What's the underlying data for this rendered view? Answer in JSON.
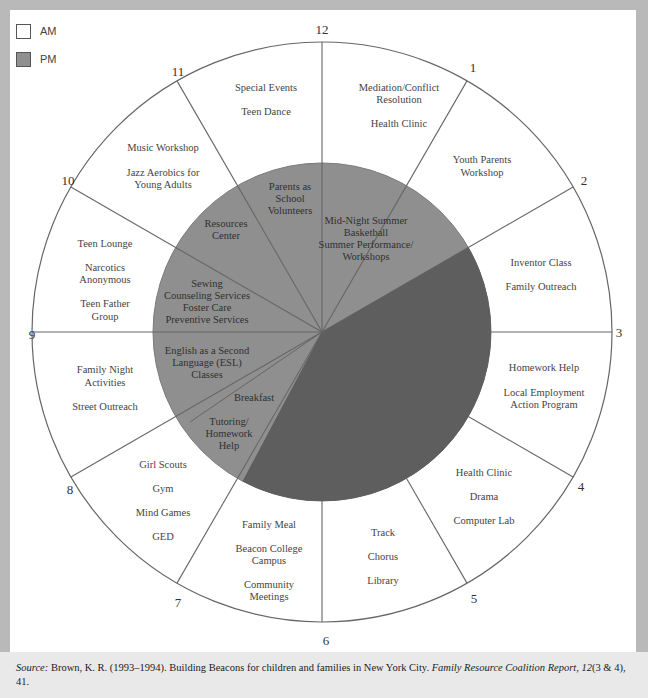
{
  "legend": {
    "items": [
      {
        "label": "AM",
        "color": "#ffffff"
      },
      {
        "label": "PM",
        "color": "#8f8f8f"
      }
    ]
  },
  "colors": {
    "background": "#b9b9b9",
    "panel": "#ffffff",
    "pm_fill": "#8f8f8f",
    "unused_fill": "#5e5e5e",
    "line": "#666666"
  },
  "clock": {
    "hours": [
      "12",
      "1",
      "2",
      "3",
      "4",
      "5",
      "6",
      "7",
      "8",
      "9",
      "10",
      "11"
    ]
  },
  "outer_segments": [
    {
      "hour_range": "12-1",
      "lines": [
        "Mediation/Conflict",
        "Resolution",
        "",
        "Health Clinic"
      ]
    },
    {
      "hour_range": "1-2",
      "lines": [
        "Youth Parents",
        "Workshop"
      ]
    },
    {
      "hour_range": "2-3",
      "lines": [
        "Inventor Class",
        "",
        "Family Outreach"
      ]
    },
    {
      "hour_range": "3-4",
      "lines": [
        "Homework Help",
        "",
        "Local Employment",
        "Action Program"
      ]
    },
    {
      "hour_range": "4-5",
      "lines": [
        "Health Clinic",
        "",
        "Drama",
        "",
        "Computer Lab"
      ]
    },
    {
      "hour_range": "5-6",
      "lines": [
        "Track",
        "",
        "Chorus",
        "",
        "Library"
      ]
    },
    {
      "hour_range": "6-7",
      "lines": [
        "Family Meal",
        "",
        "Beacon College",
        "Campus",
        "",
        "Community",
        "Meetings"
      ]
    },
    {
      "hour_range": "7-8",
      "lines": [
        "Girl Scouts",
        "",
        "Gym",
        "",
        "Mind Games",
        "",
        "GED"
      ]
    },
    {
      "hour_range": "8-9",
      "lines": [
        "Family Night",
        "Activities",
        "",
        "Street Outreach"
      ]
    },
    {
      "hour_range": "9-10",
      "lines": [
        "Teen Lounge",
        "",
        "Narcotics",
        "Anonymous",
        "",
        "Teen Father",
        "Group"
      ]
    },
    {
      "hour_range": "10-11",
      "lines": [
        "Music Workshop",
        "",
        "Jazz Aerobics for",
        "Young Adults"
      ]
    },
    {
      "hour_range": "11-12",
      "lines": [
        "Special Events",
        "",
        "Teen Dance"
      ]
    }
  ],
  "inner_segments": [
    {
      "hour_range": "12-2",
      "lines": [
        "Mid-Night Summer",
        "Basketball",
        "Summer Performance/",
        "Workshops"
      ]
    },
    {
      "hour_range": "11-12",
      "lines": [
        "Parents as",
        "School",
        "Volunteers"
      ]
    },
    {
      "hour_range": "10-11",
      "lines": [
        "Resources",
        "Center"
      ]
    },
    {
      "hour_range": "9-10",
      "lines": [
        "Sewing",
        "Counseling Services",
        "Foster Care",
        "Preventive Services"
      ]
    },
    {
      "hour_range": "8-9",
      "lines": [
        "English as a Second",
        "Language (ESL)",
        "Classes"
      ]
    },
    {
      "hour_range": "7-8 (upper)",
      "lines": [
        "Breakfast"
      ]
    },
    {
      "hour_range": "7-8 (lower)",
      "lines": [
        "Tutoring/",
        "Homework",
        "Help"
      ]
    }
  ],
  "source": {
    "label": "Source:",
    "text": " Brown, K. R. (1993–1994). Building Beacons for children and families in New York City. ",
    "journal": "Family Resource Coalition Report, 12",
    "tail": "(3 & 4), 41."
  }
}
